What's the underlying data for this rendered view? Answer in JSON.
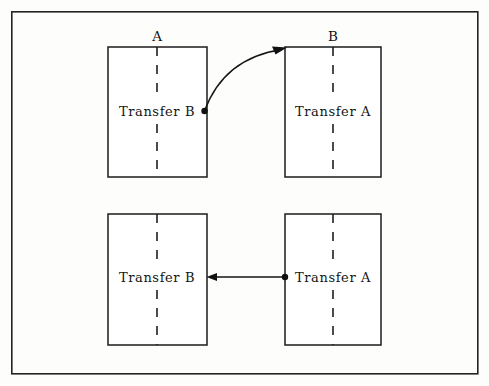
{
  "figure": {
    "background_color": "#fdfdfc",
    "line_color": "#1b1b1b",
    "frame": {
      "x": 11,
      "y": 11,
      "width": 467,
      "height": 363
    },
    "column_headers": [
      {
        "text": "A",
        "x": 157,
        "y": 37
      },
      {
        "text": "B",
        "x": 333,
        "y": 37
      }
    ],
    "boxes": [
      {
        "id": "top-left",
        "label": "Transfer B",
        "x": 108,
        "y": 47,
        "width": 99,
        "height": 130,
        "label_x": 157,
        "label_y": 112,
        "dash_x": 157
      },
      {
        "id": "top-right",
        "label": "Transfer A",
        "x": 285,
        "y": 47,
        "width": 96,
        "height": 130,
        "label_x": 333,
        "label_y": 112,
        "dash_x": 333
      },
      {
        "id": "bottom-left",
        "label": "Transfer B",
        "x": 108,
        "y": 214,
        "width": 99,
        "height": 131,
        "label_x": 157,
        "label_y": 278,
        "dash_x": 157
      },
      {
        "id": "bottom-right",
        "label": "Transfer A",
        "x": 285,
        "y": 214,
        "width": 96,
        "height": 131,
        "label_x": 333,
        "label_y": 278,
        "dash_x": 333
      }
    ],
    "connectors": [
      {
        "id": "curved-arrow-top",
        "style": "curved",
        "from_x": 204,
        "from_y": 111,
        "to_x": 286,
        "to_y": 48,
        "control_x": 222,
        "control_y": 56,
        "has_source_dot": true,
        "has_arrow_head": true
      },
      {
        "id": "straight-arrow-bottom",
        "style": "straight",
        "from_x": 285,
        "from_y": 277,
        "to_x": 208,
        "to_y": 277,
        "has_source_dot": true,
        "has_arrow_head": true
      }
    ]
  }
}
